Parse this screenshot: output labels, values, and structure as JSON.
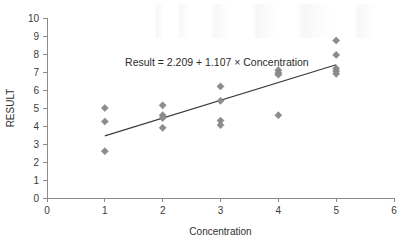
{
  "chart_data": {
    "type": "scatter",
    "title": "",
    "xlabel": "Concentration",
    "ylabel": "RESULT",
    "xlim": [
      0,
      6
    ],
    "ylim": [
      0,
      10
    ],
    "xticks": [
      "0",
      "1",
      "2",
      "3",
      "4",
      "5",
      "6"
    ],
    "yticks": [
      "0",
      "1",
      "2",
      "3",
      "4",
      "5",
      "6",
      "7",
      "8",
      "9",
      "10"
    ],
    "grid": false,
    "legend": null,
    "annotations": [
      {
        "name": "regression-equation",
        "text": "Result = 2.209 + 1.107 × Concentration",
        "x": 1.35,
        "y": 7.35
      }
    ],
    "series": [
      {
        "name": "Observations",
        "marker": "diamond",
        "color": "#8c8c8c",
        "points": [
          {
            "x": 1,
            "y": 5.0
          },
          {
            "x": 1,
            "y": 4.25
          },
          {
            "x": 1,
            "y": 2.6
          },
          {
            "x": 2,
            "y": 5.15
          },
          {
            "x": 2,
            "y": 4.6
          },
          {
            "x": 2,
            "y": 4.45
          },
          {
            "x": 2,
            "y": 3.9
          },
          {
            "x": 3,
            "y": 6.2
          },
          {
            "x": 3,
            "y": 5.4
          },
          {
            "x": 3,
            "y": 4.3
          },
          {
            "x": 3,
            "y": 4.05
          },
          {
            "x": 4,
            "y": 7.1
          },
          {
            "x": 4,
            "y": 6.95
          },
          {
            "x": 4,
            "y": 6.85
          },
          {
            "x": 4,
            "y": 4.6
          },
          {
            "x": 5,
            "y": 8.75
          },
          {
            "x": 5,
            "y": 7.95
          },
          {
            "x": 5,
            "y": 7.2
          },
          {
            "x": 5,
            "y": 7.05
          },
          {
            "x": 5,
            "y": 6.9
          }
        ]
      }
    ],
    "fit_line": {
      "name": "regression-line",
      "intercept": 2.209,
      "slope": 1.107,
      "x_start": 1.0,
      "x_end": 5.0,
      "y_start": 3.45,
      "y_end": 7.4,
      "color": "#3b3b3b"
    }
  }
}
